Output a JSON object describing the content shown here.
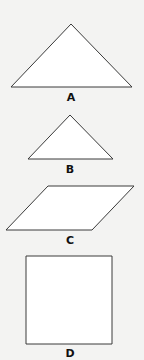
{
  "figure": {
    "background_color": "#f3f3f2",
    "shape_fill": "#ffffff",
    "shape_stroke": "#3a3a3a",
    "shapes": [
      {
        "id": "A",
        "label": "A",
        "type": "triangle",
        "points": "71,24 11,87 132,87",
        "label_x": 71,
        "label_y": 92
      },
      {
        "id": "B",
        "label": "B",
        "type": "triangle",
        "points": "70,115 28,159 113,159",
        "label_x": 70,
        "label_y": 164
      },
      {
        "id": "C",
        "label": "C",
        "type": "parallelogram",
        "points": "48,186 134,186 92,230 6,230",
        "label_x": 70,
        "label_y": 235
      },
      {
        "id": "D",
        "label": "D",
        "type": "square",
        "points": "26,256 112,256 112,344 26,344",
        "label_x": 70,
        "label_y": 348
      }
    ]
  }
}
